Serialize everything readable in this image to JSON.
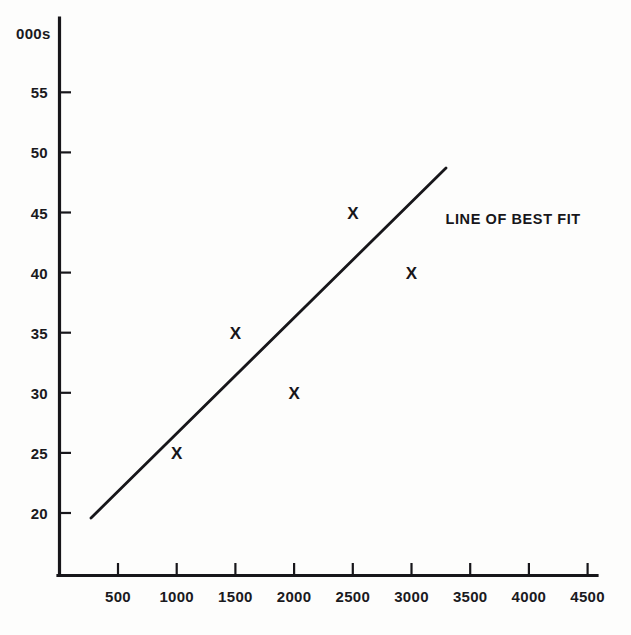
{
  "chart_data": {
    "type": "scatter",
    "title": "",
    "subtitle": "",
    "xlabel": "",
    "ylabel": "000s",
    "xlim": [
      0,
      4750
    ],
    "ylim": [
      17.5,
      57.5
    ],
    "grid": false,
    "legend_position": "none",
    "x_ticks": [
      500,
      1000,
      1500,
      2000,
      2500,
      3000,
      3500,
      4000,
      4500
    ],
    "x_tick_labels": [
      "500",
      "1000",
      "1500",
      "2000",
      "2500",
      "3000",
      "3500",
      "4000",
      "4500"
    ],
    "y_ticks": [
      20,
      25,
      30,
      35,
      40,
      45,
      50,
      55
    ],
    "y_tick_labels": [
      "20",
      "25",
      "30",
      "35",
      "40",
      "45",
      "50",
      "55"
    ],
    "marker_glyph": "X",
    "points": [
      {
        "x": 1000,
        "y": 25,
        "label": "X"
      },
      {
        "x": 1500,
        "y": 35,
        "label": "X"
      },
      {
        "x": 2000,
        "y": 30,
        "label": "X"
      },
      {
        "x": 2500,
        "y": 45,
        "label": "X"
      },
      {
        "x": 3000,
        "y": 40,
        "label": "X"
      }
    ],
    "trendline": {
      "name": "LINE OF BEST FIT",
      "x_start": 270,
      "y_start": 19.7,
      "x_end": 3270,
      "y_end": 48.0
    },
    "annotations": [
      {
        "text": "LINE OF BEST FIT",
        "x": 3460,
        "y": 44.5
      }
    ],
    "colors": {
      "ink": "#17161a",
      "background": "#fdfdfc"
    }
  }
}
